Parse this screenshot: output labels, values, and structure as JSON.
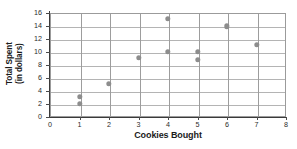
{
  "chart_data": {
    "type": "scatter",
    "title": "",
    "xlabel": "Cookies Bought",
    "ylabel_line1": "Total Spent",
    "ylabel_line2": "(in dollars)",
    "xlim": [
      0,
      8
    ],
    "ylim": [
      0,
      16
    ],
    "xticks": [
      "0",
      "1",
      "2",
      "3",
      "4",
      "5",
      "6",
      "7",
      "8"
    ],
    "yticks": [
      "0",
      "2",
      "4",
      "6",
      "8",
      "10",
      "12",
      "14",
      "16"
    ],
    "grid": "both",
    "legend": "none",
    "marker_color": "#8d8d8d",
    "axis_color": "#3a3a3a",
    "grid_color": "#b4b4b4",
    "points": [
      {
        "x": 1,
        "y": 3
      },
      {
        "x": 1,
        "y": 2
      },
      {
        "x": 2,
        "y": 5
      },
      {
        "x": 3,
        "y": 9
      },
      {
        "x": 4,
        "y": 15
      },
      {
        "x": 4,
        "y": 10
      },
      {
        "x": 5,
        "y": 10
      },
      {
        "x": 5,
        "y": 8.7
      },
      {
        "x": 6,
        "y": 13.9
      },
      {
        "x": 7,
        "y": 11
      }
    ]
  }
}
